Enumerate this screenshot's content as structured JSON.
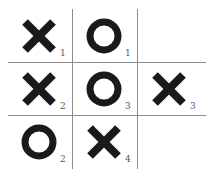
{
  "board": {
    "cells": [
      {
        "row": 0,
        "col": 0,
        "mark": "X",
        "move": "1"
      },
      {
        "row": 0,
        "col": 1,
        "mark": "O",
        "move": "1"
      },
      {
        "row": 0,
        "col": 2,
        "mark": "",
        "move": ""
      },
      {
        "row": 1,
        "col": 0,
        "mark": "X",
        "move": "2"
      },
      {
        "row": 1,
        "col": 1,
        "mark": "O",
        "move": "3"
      },
      {
        "row": 1,
        "col": 2,
        "mark": "X",
        "move": "3"
      },
      {
        "row": 2,
        "col": 0,
        "mark": "O",
        "move": "2"
      },
      {
        "row": 2,
        "col": 1,
        "mark": "X",
        "move": "4"
      },
      {
        "row": 2,
        "col": 2,
        "mark": "",
        "move": ""
      }
    ],
    "colors": {
      "mark": "#1a1a1a",
      "grid": "#8c8c8c"
    }
  }
}
